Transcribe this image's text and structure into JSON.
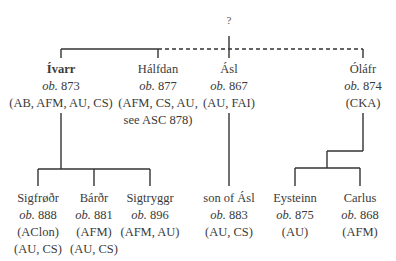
{
  "root": {
    "label": "?"
  },
  "generation1": [
    {
      "name": "Ívarr",
      "bold": true,
      "ob_label": "ob.",
      "year": "873",
      "sources": [
        "(AB, AFM, AU, CS)"
      ]
    },
    {
      "name": "Hálfdan",
      "bold": false,
      "ob_label": "ob.",
      "year": "877",
      "sources": [
        "(AFM, CS, AU,",
        "see ASC 878)"
      ]
    },
    {
      "name": "Ásl",
      "bold": false,
      "ob_label": "ob.",
      "year": "867",
      "sources": [
        "(AU, FAI)"
      ]
    },
    {
      "name": "Óláfr",
      "bold": false,
      "ob_label": "ob.",
      "year": "874",
      "sources": [
        "(CKA)"
      ]
    }
  ],
  "generation2": [
    {
      "name": "Sigfrøðr",
      "parent": "Ívarr",
      "ob_label": "ob.",
      "year": "888",
      "sources": [
        "(AClon)",
        "(AU, CS)"
      ]
    },
    {
      "name": "Bárðr",
      "parent": "Ívarr",
      "ob_label": "ob.",
      "year": "881",
      "sources": [
        "(AFM)",
        "(AU, CS)"
      ]
    },
    {
      "name": "Sigtryggr",
      "parent": "Ívarr",
      "ob_label": "ob.",
      "year": "896",
      "sources": [
        "(AFM, AU)"
      ]
    },
    {
      "name": "son of Ásl",
      "parent": "Ásl",
      "ob_label": "ob.",
      "year": "883",
      "sources": [
        "(AU, CS)"
      ]
    },
    {
      "name": "Eysteinn",
      "parent": "Óláfr",
      "ob_label": "ob.",
      "year": "875",
      "sources": [
        "(AU)"
      ]
    },
    {
      "name": "Carlus",
      "parent": "Óláfr",
      "ob_label": "ob.",
      "year": "868",
      "sources": [
        "(AFM)"
      ]
    }
  ],
  "legend": {
    "solid_line": "certain relationship",
    "dashed_line": "uncertain relationship"
  }
}
